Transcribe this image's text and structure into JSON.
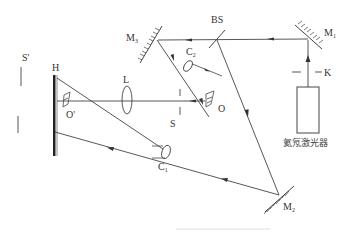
{
  "diagram": {
    "type": "holography-optical-setup",
    "labels": {
      "m1": "M",
      "m1_sub": "1",
      "m2": "M",
      "m2_sub": "2",
      "m3": "M",
      "m3_sub": "3",
      "bs": "BS",
      "k": "K",
      "laser": "氦氖激光器",
      "c1": "C",
      "c1_sub": "1",
      "c2": "C",
      "c2_sub": "2",
      "o": "O",
      "o_prime": "O'",
      "s": "S",
      "s_prime": "S'",
      "h": "H",
      "l": "L"
    },
    "components": [
      {
        "id": "laser",
        "name": "He-Ne laser"
      },
      {
        "id": "K",
        "name": "shutter"
      },
      {
        "id": "M1",
        "name": "mirror 1"
      },
      {
        "id": "BS",
        "name": "beam splitter"
      },
      {
        "id": "M2",
        "name": "mirror 2"
      },
      {
        "id": "M3",
        "name": "mirror 3"
      },
      {
        "id": "C1",
        "name": "beam expander 1"
      },
      {
        "id": "C2",
        "name": "beam expander 2"
      },
      {
        "id": "O",
        "name": "object"
      },
      {
        "id": "L",
        "name": "lens"
      },
      {
        "id": "S",
        "name": "aperture"
      },
      {
        "id": "H",
        "name": "holographic plate"
      },
      {
        "id": "O'",
        "name": "virtual image"
      },
      {
        "id": "S'",
        "name": "image of aperture"
      }
    ],
    "colors": {
      "line": "#444444",
      "text": "#333333",
      "background": "#ffffff"
    }
  }
}
